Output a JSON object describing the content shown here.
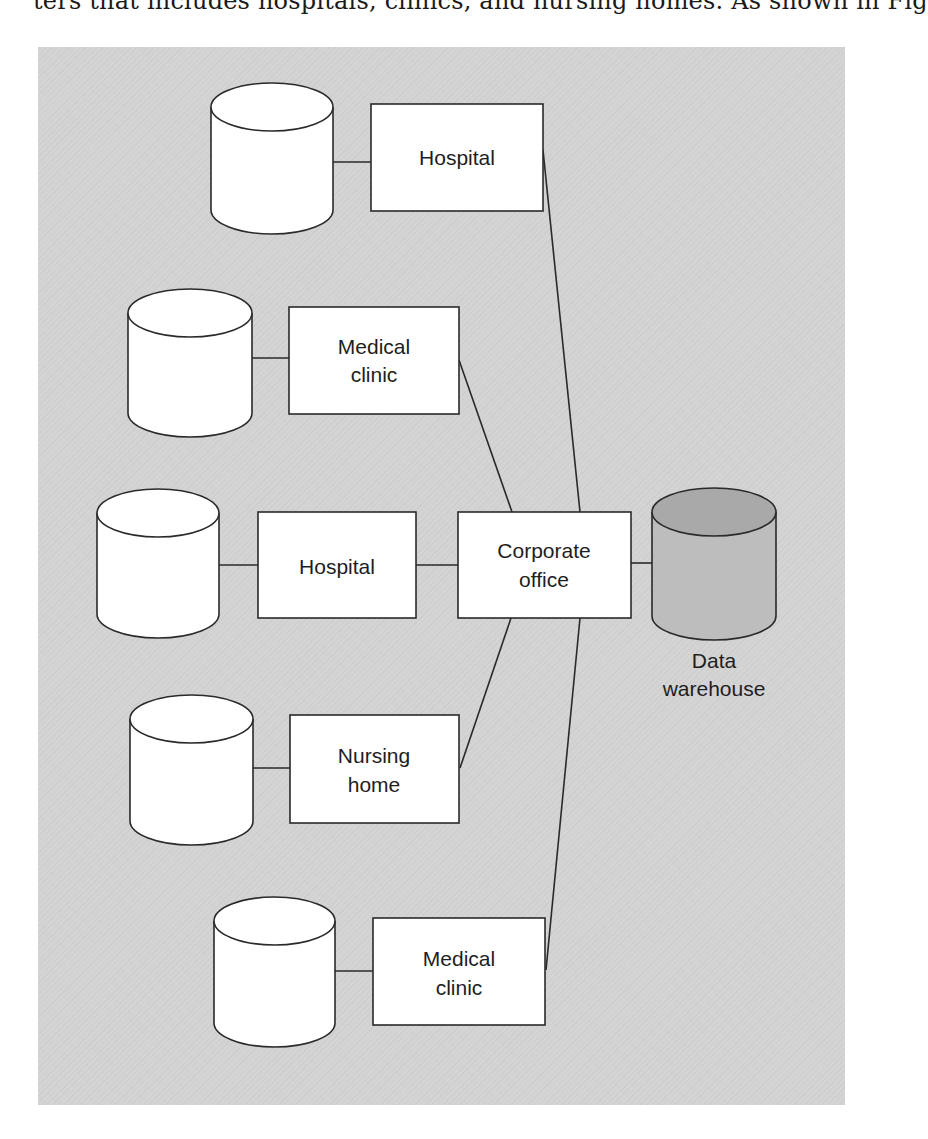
{
  "page_text": {
    "clipped_line": "ters that includes hospitals, clinics, and nursing homes. As shown in Fig"
  },
  "diagram": {
    "background_color": "#d3d3d3",
    "hub": {
      "id": "corporate",
      "label_lines": [
        "Corporate",
        "office"
      ]
    },
    "warehouse": {
      "id": "data-warehouse",
      "label_lines": [
        "Data",
        "warehouse"
      ],
      "fill_top": "#a9a9a9",
      "fill_body": "#bdbdbd"
    },
    "sites": [
      {
        "id": "site-1",
        "label_lines": [
          "Hospital"
        ],
        "database": "local-database"
      },
      {
        "id": "site-2",
        "label_lines": [
          "Medical",
          "clinic"
        ],
        "database": "local-database"
      },
      {
        "id": "site-3",
        "label_lines": [
          "Hospital"
        ],
        "database": "local-database"
      },
      {
        "id": "site-4",
        "label_lines": [
          "Nursing",
          "home"
        ],
        "database": "local-database"
      },
      {
        "id": "site-5",
        "label_lines": [
          "Medical",
          "clinic"
        ],
        "database": "local-database"
      }
    ],
    "edges": [
      [
        "site-1-db",
        "site-1"
      ],
      [
        "site-2-db",
        "site-2"
      ],
      [
        "site-3-db",
        "site-3"
      ],
      [
        "site-4-db",
        "site-4"
      ],
      [
        "site-5-db",
        "site-5"
      ],
      [
        "site-1",
        "corporate"
      ],
      [
        "site-2",
        "corporate"
      ],
      [
        "site-3",
        "corporate"
      ],
      [
        "site-4",
        "corporate"
      ],
      [
        "site-5",
        "corporate"
      ],
      [
        "corporate",
        "data-warehouse"
      ]
    ]
  }
}
